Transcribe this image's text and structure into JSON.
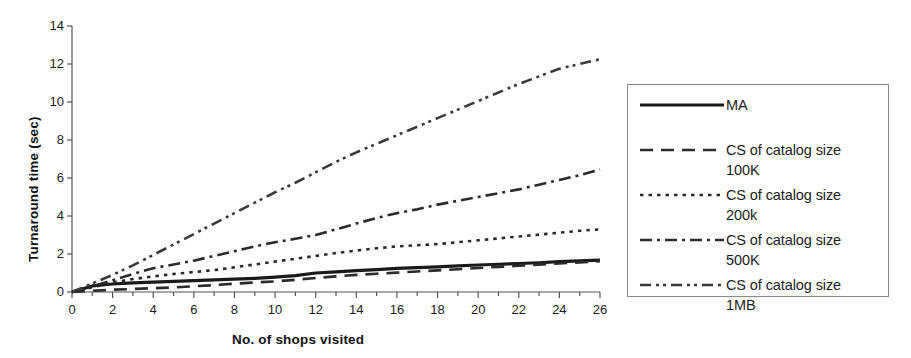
{
  "chart_data": {
    "type": "line",
    "title": "",
    "xlabel": "No. of shops visited",
    "ylabel": "Turnaround time (sec)",
    "xlim": [
      0,
      26
    ],
    "ylim": [
      0,
      14
    ],
    "xticks": [
      0,
      2,
      4,
      6,
      8,
      10,
      12,
      14,
      16,
      18,
      20,
      22,
      24,
      26
    ],
    "yticks": [
      0,
      2,
      4,
      6,
      8,
      10,
      12,
      14
    ],
    "xtick_labels": [
      "0",
      "2",
      "4",
      "6",
      "8",
      "10",
      "12",
      "14",
      "16",
      "18",
      "20",
      "22",
      "24",
      "26"
    ],
    "ytick_labels": [
      "0",
      "2",
      "4",
      "6",
      "8",
      "10",
      "12",
      "14"
    ],
    "minor_xtick_interval": 1,
    "grid": false,
    "legend_position": "right-outside",
    "x": [
      0,
      1,
      2,
      3,
      4,
      5,
      6,
      7,
      8,
      9,
      10,
      11,
      12,
      13,
      14,
      15,
      16,
      17,
      18,
      19,
      20,
      21,
      22,
      23,
      24,
      25,
      26
    ],
    "series": [
      {
        "name": "MA",
        "style": "solid",
        "color": "#1a1a1a",
        "values": [
          0,
          0.32,
          0.42,
          0.48,
          0.52,
          0.56,
          0.6,
          0.64,
          0.68,
          0.72,
          0.78,
          0.86,
          1.0,
          1.06,
          1.12,
          1.18,
          1.24,
          1.28,
          1.32,
          1.38,
          1.42,
          1.46,
          1.5,
          1.54,
          1.6,
          1.64,
          1.68
        ]
      },
      {
        "name": "CS of catalog size 100K",
        "style": "dashed",
        "color": "#2b2b2b",
        "values": [
          0,
          0.06,
          0.12,
          0.16,
          0.2,
          0.24,
          0.3,
          0.36,
          0.44,
          0.5,
          0.56,
          0.64,
          0.74,
          0.82,
          0.9,
          0.96,
          1.02,
          1.08,
          1.14,
          1.2,
          1.26,
          1.32,
          1.38,
          1.44,
          1.5,
          1.56,
          1.62
        ]
      },
      {
        "name": "CS of catalog size 200k",
        "style": "dotted",
        "color": "#2b2b2b",
        "values": [
          0,
          0.25,
          0.5,
          0.68,
          0.82,
          0.95,
          1.05,
          1.15,
          1.3,
          1.45,
          1.6,
          1.75,
          1.9,
          2.05,
          2.18,
          2.3,
          2.4,
          2.46,
          2.52,
          2.62,
          2.72,
          2.82,
          2.92,
          3.02,
          3.12,
          3.22,
          3.3
        ]
      },
      {
        "name": "CS of catalog size 500K",
        "style": "dashdot",
        "color": "#2b2b2b",
        "values": [
          0,
          0.3,
          0.62,
          0.95,
          1.25,
          1.45,
          1.65,
          1.9,
          2.15,
          2.4,
          2.62,
          2.8,
          3.0,
          3.3,
          3.6,
          3.9,
          4.15,
          4.35,
          4.6,
          4.8,
          5.0,
          5.2,
          5.4,
          5.65,
          5.9,
          6.15,
          6.45
        ]
      },
      {
        "name": "CS of catalog size 1MB",
        "style": "dashdotdot",
        "color": "#3a3a3a",
        "values": [
          0,
          0.45,
          0.9,
          1.4,
          1.95,
          2.5,
          3.05,
          3.6,
          4.15,
          4.7,
          5.25,
          5.75,
          6.3,
          6.85,
          7.35,
          7.8,
          8.25,
          8.7,
          9.15,
          9.6,
          10.05,
          10.5,
          10.95,
          11.35,
          11.75,
          12.0,
          12.25
        ]
      }
    ]
  },
  "legend": {
    "entries": [
      {
        "label": "MA",
        "style": "solid"
      },
      {
        "label": "CS of catalog size\n100K",
        "style": "dashed"
      },
      {
        "label": "CS of catalog size\n200k",
        "style": "dotted"
      },
      {
        "label": "CS of catalog size\n500K",
        "style": "dashdot"
      },
      {
        "label": "CS of catalog size\n1MB",
        "style": "dashdotdot"
      }
    ]
  },
  "colors": {
    "axis": "#555555",
    "text": "#1a1a1a",
    "legend_border": "#8a8a8a",
    "background": "#ffffff"
  }
}
